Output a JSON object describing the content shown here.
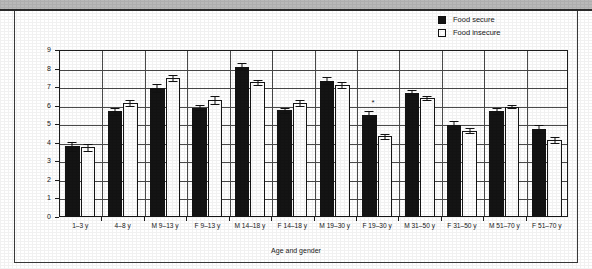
{
  "legend": {
    "position": "top-right",
    "entries": [
      {
        "label": "Food secure",
        "swatch": "filled-black-square"
      },
      {
        "label": "Food insecure",
        "swatch": "hollow-white-square"
      }
    ]
  },
  "axes": {
    "y_title": "Number of servings",
    "x_title": "Age and gender",
    "y_ticks": [
      "0",
      "1",
      "2",
      "3",
      "4",
      "5",
      "6",
      "7",
      "8",
      "9"
    ]
  },
  "annotations": [
    {
      "text": "*",
      "category": "F 19–30 y",
      "note": "significance marker above F 19–30 y group"
    }
  ],
  "chart_data": {
    "type": "bar",
    "title": "",
    "xlabel": "Age and gender",
    "ylabel": "Number of servings",
    "ylim": [
      0,
      9
    ],
    "grid": true,
    "legend_position": "top-right",
    "categories": [
      "1–3 y",
      "4–8 y",
      "M 9–13 y",
      "F 9–13 y",
      "M 14–18 y",
      "F 14–18 y",
      "M 19–30 y",
      "F 19–30 y",
      "M 31–50 y",
      "F 31–50 y",
      "M 51–70 y",
      "F 51–70 y"
    ],
    "series": [
      {
        "name": "Food secure",
        "color": "#141414",
        "values": [
          3.8,
          5.7,
          6.95,
          5.9,
          8.1,
          5.75,
          7.35,
          5.5,
          6.7,
          4.95,
          5.7,
          4.75
        ],
        "errors": [
          0.25,
          0.2,
          0.2,
          0.15,
          0.2,
          0.15,
          0.2,
          0.2,
          0.15,
          0.2,
          0.15,
          0.2
        ]
      },
      {
        "name": "Food insecure",
        "color": "#ffffff",
        "values": [
          3.75,
          6.15,
          7.5,
          6.3,
          7.25,
          6.15,
          7.1,
          4.35,
          6.4,
          4.65,
          5.95,
          4.15
        ],
        "errors": [
          0.2,
          0.15,
          0.15,
          0.2,
          0.15,
          0.15,
          0.15,
          0.15,
          0.1,
          0.15,
          0.1,
          0.15
        ]
      }
    ]
  }
}
